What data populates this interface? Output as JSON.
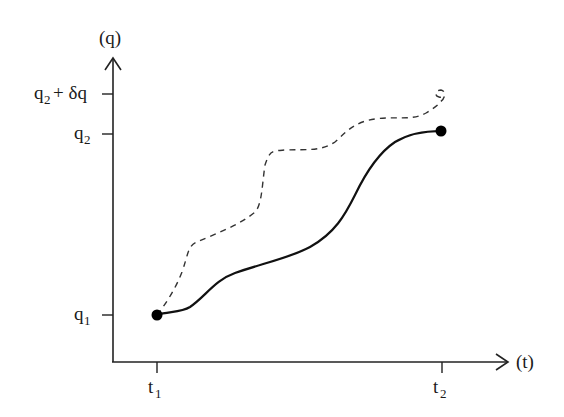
{
  "diagram": {
    "type": "trajectory-variation-plot",
    "axes": {
      "y_label": "(q)",
      "x_label": "(t)",
      "y_ticks": [
        {
          "main": "q",
          "sub": "2",
          "suffix": " + δq",
          "y": 94
        },
        {
          "main": "q",
          "sub": "2",
          "suffix": "",
          "y": 134
        },
        {
          "main": "q",
          "sub": "1",
          "suffix": "",
          "y": 315
        }
      ],
      "x_ticks": [
        {
          "main": "t",
          "sub": "1",
          "x": 157
        },
        {
          "main": "t",
          "sub": "2",
          "x": 442
        }
      ]
    },
    "curves": [
      {
        "name": "actual-path",
        "style": "solid",
        "from": "(t1, q1)",
        "to": "(t2, q2)"
      },
      {
        "name": "varied-path",
        "style": "dashed",
        "from": "(t1, q1)",
        "to": "(t2, q2 + δq)"
      }
    ],
    "endpoints": [
      {
        "name": "start-point",
        "x": 157,
        "y": 315
      },
      {
        "name": "end-point",
        "x": 441,
        "y": 131
      }
    ],
    "colors": {
      "stroke": "#111111",
      "dashed": "#333333",
      "background": "#ffffff"
    }
  },
  "labels": {
    "y_axis": "(q)",
    "x_axis": "(t)",
    "q2_dq_main": "q",
    "q2_dq_sub": "2",
    "q2_dq_rest": "+ δq",
    "q2_main": "q",
    "q2_sub": "2",
    "q1_main": "q",
    "q1_sub": "1",
    "t1_main": "t",
    "t1_sub": "1",
    "t2_main": "t",
    "t2_sub": "2"
  }
}
